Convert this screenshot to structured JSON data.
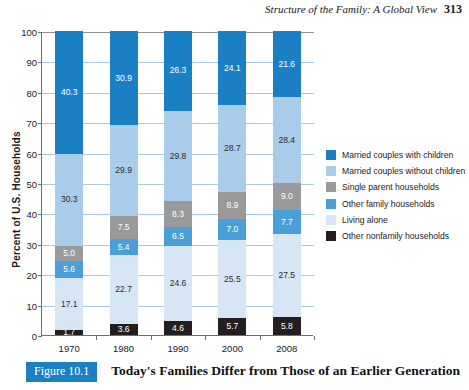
{
  "header": {
    "running_title": "Structure of the Family: A Global View",
    "page_number": "313"
  },
  "caption": {
    "figure_label": "Figure 10.1",
    "title": "Today's Families Differ from Those of an Earlier Generation"
  },
  "colors": {
    "married_with_children": "#1b7fc4",
    "married_without_children": "#a8cce9",
    "single_parent": "#9a9a9a",
    "other_family": "#4a9fd8",
    "living_alone": "#d6e6f5",
    "other_nonfamily": "#231f20",
    "grid": "#a9c8e2",
    "axis": "#6f6f6f",
    "badge": "#1b7fc4"
  },
  "chart_data": {
    "type": "bar",
    "stacked": true,
    "title": "Today's Families Differ from Those of an Earlier Generation",
    "xlabel": "",
    "ylabel": "Percent of U.S. Households",
    "ylim": [
      0,
      100
    ],
    "yticks": [
      0,
      10,
      20,
      30,
      40,
      50,
      60,
      70,
      80,
      90,
      100
    ],
    "grid": true,
    "legend_position": "right",
    "categories": [
      "1970",
      "1980",
      "1990",
      "2000",
      "2008"
    ],
    "series": [
      {
        "name": "Married couples with children",
        "color": "#1b7fc4",
        "values": [
          40.3,
          30.9,
          26.3,
          24.1,
          21.6
        ]
      },
      {
        "name": "Married couples without children",
        "color": "#a8cce9",
        "values": [
          30.3,
          29.9,
          29.8,
          28.7,
          28.4
        ]
      },
      {
        "name": "Single parent households",
        "color": "#9a9a9a",
        "values": [
          5.0,
          7.5,
          8.3,
          8.9,
          9.0
        ]
      },
      {
        "name": "Other family households",
        "color": "#4a9fd8",
        "values": [
          5.6,
          5.4,
          6.5,
          7.0,
          7.7
        ]
      },
      {
        "name": "Living alone",
        "color": "#d6e6f5",
        "values": [
          17.1,
          22.7,
          24.6,
          25.5,
          27.5
        ]
      },
      {
        "name": "Other nonfamily households",
        "color": "#231f20",
        "values": [
          1.7,
          3.6,
          4.6,
          5.7,
          5.8
        ]
      }
    ]
  }
}
